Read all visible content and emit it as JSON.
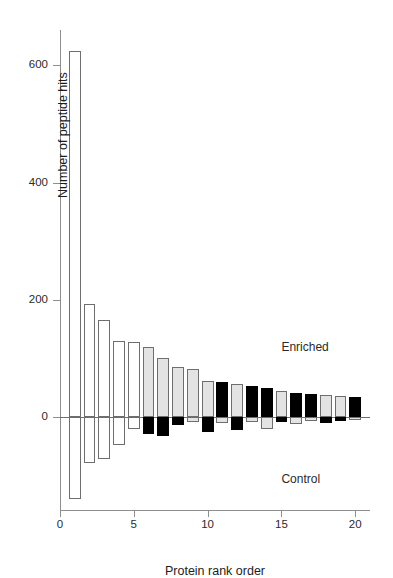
{
  "chart_data": {
    "type": "bar",
    "title": "",
    "subtitle": "",
    "xlabel": "Protein rank order",
    "ylabel": "Number of peptide hits",
    "grid": false,
    "legend": null,
    "xlim": [
      0,
      21
    ],
    "ylim": [
      -160,
      660
    ],
    "xticks": [
      0,
      5,
      10,
      15,
      20
    ],
    "xtick_labels": [
      "0",
      "5",
      "10",
      "15",
      "20"
    ],
    "yticks": [
      0,
      200,
      400,
      600
    ],
    "ytick_labels": [
      "0",
      "200",
      "400",
      "600"
    ],
    "zero_reference_line": 0,
    "annotations": [
      {
        "text": "Enriched",
        "x": 15.0,
        "y": 120
      },
      {
        "text": "Control",
        "x": 15.0,
        "y": -105
      }
    ],
    "categories": [
      1,
      2,
      3,
      4,
      5,
      6,
      7,
      8,
      9,
      10,
      11,
      12,
      13,
      14,
      15,
      16,
      17,
      18,
      19,
      20
    ],
    "series": [
      {
        "name": "Enriched",
        "values": [
          624,
          193,
          165,
          130,
          128,
          119,
          100,
          85,
          82,
          62,
          60,
          57,
          53,
          50,
          45,
          42,
          40,
          38,
          36,
          35
        ],
        "fills": [
          "white",
          "white",
          "white",
          "white",
          "white",
          "gray",
          "gray",
          "gray",
          "gray",
          "gray",
          "black",
          "gray",
          "black",
          "black",
          "gray",
          "black",
          "black",
          "gray",
          "gray",
          "black"
        ]
      },
      {
        "name": "Control",
        "values": [
          -140,
          -78,
          -72,
          -48,
          -20,
          -28,
          -33,
          -14,
          -8,
          -26,
          -10,
          -22,
          -9,
          -20,
          -8,
          -12,
          -7,
          -10,
          -6,
          -5
        ],
        "fills": [
          "white",
          "white",
          "white",
          "white",
          "white",
          "black",
          "black",
          "black",
          "gray",
          "black",
          "gray",
          "black",
          "gray",
          "gray",
          "black",
          "gray",
          "gray",
          "black",
          "black",
          "gray"
        ]
      }
    ]
  }
}
